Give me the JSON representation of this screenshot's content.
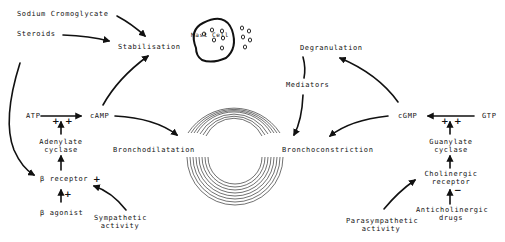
{
  "diagram": {
    "type": "pathway",
    "labels": {
      "sodium_cromoglycate": "Sodium  Cromoglycate",
      "steroids": "Steroids",
      "stabilisation": "Stabilisation",
      "mast_cell": "Mast Cell",
      "degranulation": "Degranulation",
      "mediators": "Mediators",
      "atp": "ATP",
      "camp": "cAMP",
      "cgmp": "cGMP",
      "gtp": "GTP",
      "adenylate_cyclase_1": "Adenylate",
      "adenylate_cyclase_2": "cyclase",
      "guanylate_cyclase_1": "Guanylate",
      "guanylate_cyclase_2": "cyclase",
      "bronchodilatation": "Bronchodilatation",
      "bronchoconstriction": "Bronchoconstriction",
      "beta_receptor": "β receptor",
      "beta_agonist": "β agonist",
      "sympathetic_1": "Sympathetic",
      "sympathetic_2": "activity",
      "cholinergic_1": "Cholinergic",
      "cholinergic_2": "receptor",
      "anticholinergic_1": "Anticholinergic",
      "anticholinergic_2": "drugs",
      "parasympathetic_1": "Parasympathetic",
      "parasympathetic_2": "activity"
    },
    "signs": {
      "plus": "+",
      "minus": "−"
    },
    "edges": [
      {
        "from": "Sodium Cromoglycate",
        "to": "Stabilisation"
      },
      {
        "from": "Steroids",
        "to": "Stabilisation"
      },
      {
        "from": "Steroids",
        "to": "β receptor"
      },
      {
        "from": "cAMP",
        "to": "Stabilisation"
      },
      {
        "from": "ATP",
        "to": "cAMP"
      },
      {
        "from": "Adenylate cyclase",
        "to": "ATP→cAMP",
        "sign": "+"
      },
      {
        "from": "β receptor",
        "to": "Adenylate cyclase"
      },
      {
        "from": "β agonist",
        "to": "β receptor",
        "sign": "+"
      },
      {
        "from": "Sympathetic activity",
        "to": "β receptor",
        "sign": "+"
      },
      {
        "from": "cAMP",
        "to": "Bronchodilatation"
      },
      {
        "from": "Mast Cell",
        "to": "Degranulation"
      },
      {
        "from": "Degranulation",
        "to": "Bronchoconstriction",
        "via": "Mediators"
      },
      {
        "from": "cGMP",
        "to": "Degranulation"
      },
      {
        "from": "cGMP",
        "to": "Bronchoconstriction"
      },
      {
        "from": "GTP",
        "to": "cGMP"
      },
      {
        "from": "Guanylate cyclase",
        "to": "GTP→cGMP",
        "sign": "+"
      },
      {
        "from": "Cholinergic receptor",
        "to": "Guanylate cyclase"
      },
      {
        "from": "Anticholinergic drugs",
        "to": "Cholinergic receptor",
        "sign": "−"
      },
      {
        "from": "Parasympathetic activity",
        "to": "Cholinergic receptor"
      }
    ],
    "colors": {
      "ink": "#111111",
      "background": "#ffffff"
    }
  }
}
